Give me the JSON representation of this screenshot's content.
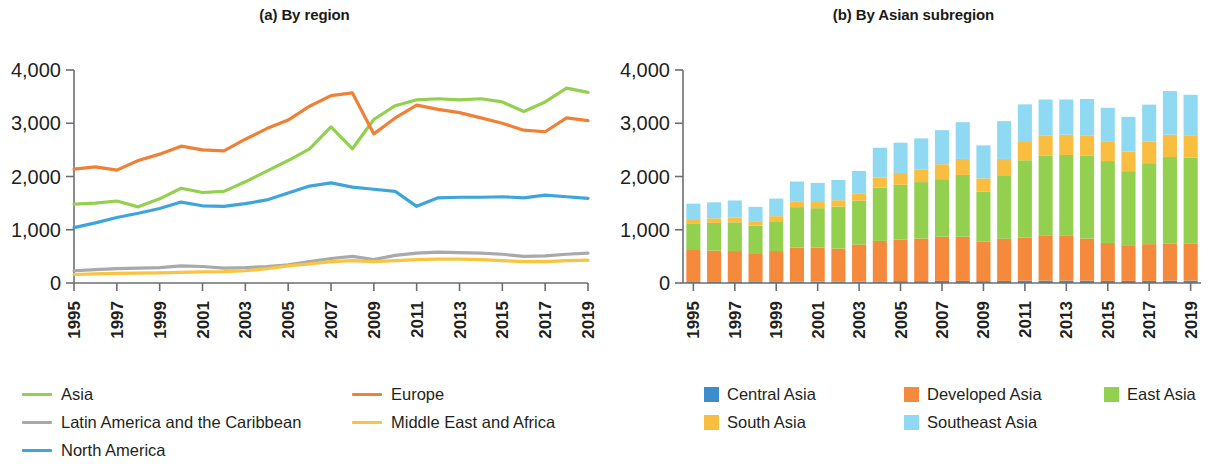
{
  "figure": {
    "panels": [
      {
        "id": "a",
        "tag": "(a)",
        "title": "By region"
      },
      {
        "id": "b",
        "tag": "(b)",
        "title": "By Asian subregion"
      }
    ]
  },
  "chart_data": [
    {
      "type": "line",
      "title": "(a) By region",
      "xlabel": "",
      "ylabel": "",
      "ylim": [
        0,
        4000
      ],
      "yticks": [
        0,
        1000,
        2000,
        3000,
        4000
      ],
      "ytick_labels": [
        "0",
        "1,000",
        "2,000",
        "3,000",
        "4,000"
      ],
      "grid": false,
      "legend_position": "below",
      "x": [
        1995,
        1996,
        1997,
        1998,
        1999,
        2000,
        2001,
        2002,
        2003,
        2004,
        2005,
        2006,
        2007,
        2008,
        2009,
        2010,
        2011,
        2012,
        2013,
        2014,
        2015,
        2016,
        2017,
        2018,
        2019
      ],
      "xtick_labels": [
        "1995",
        "1997",
        "1999",
        "2001",
        "2003",
        "2005",
        "2007",
        "2009",
        "2011",
        "2013",
        "2015",
        "2017",
        "2019"
      ],
      "series": [
        {
          "name": "Asia",
          "color": "#93d04f",
          "values": [
            1480,
            1500,
            1540,
            1430,
            1580,
            1780,
            1700,
            1720,
            1900,
            2100,
            2300,
            2520,
            2930,
            2520,
            3070,
            3330,
            3440,
            3460,
            3440,
            3460,
            3400,
            3220,
            3400,
            3660,
            3580
          ]
        },
        {
          "name": "Europe",
          "color": "#ef8036",
          "values": [
            2140,
            2180,
            2120,
            2300,
            2420,
            2570,
            2500,
            2480,
            2700,
            2900,
            3060,
            3320,
            3520,
            3570,
            2800,
            3100,
            3340,
            3260,
            3200,
            3100,
            3000,
            2870,
            2840,
            3100,
            3050
          ]
        },
        {
          "name": "Latin America and the Caribbean",
          "color": "#a7a9ac",
          "values": [
            230,
            250,
            270,
            280,
            290,
            320,
            310,
            280,
            290,
            310,
            340,
            400,
            460,
            500,
            440,
            520,
            560,
            580,
            570,
            560,
            540,
            500,
            510,
            540,
            560
          ]
        },
        {
          "name": "Middle East and Africa",
          "color": "#f9c440",
          "values": [
            160,
            170,
            180,
            185,
            190,
            200,
            210,
            215,
            230,
            270,
            320,
            360,
            400,
            420,
            400,
            420,
            440,
            450,
            450,
            440,
            420,
            400,
            400,
            420,
            430
          ]
        },
        {
          "name": "North America",
          "color": "#3da5dc",
          "values": [
            1040,
            1130,
            1230,
            1310,
            1400,
            1520,
            1450,
            1440,
            1490,
            1560,
            1690,
            1820,
            1880,
            1800,
            1760,
            1720,
            1440,
            1600,
            1610,
            1610,
            1620,
            1600,
            1650,
            1620,
            1590
          ]
        }
      ]
    },
    {
      "type": "bar",
      "stacked": true,
      "title": "(b) By Asian subregion",
      "xlabel": "",
      "ylabel": "",
      "ylim": [
        0,
        4000
      ],
      "yticks": [
        0,
        1000,
        2000,
        3000,
        4000
      ],
      "ytick_labels": [
        "0",
        "1,000",
        "2,000",
        "3,000",
        "4,000"
      ],
      "grid": false,
      "legend_position": "below",
      "categories": [
        1995,
        1996,
        1997,
        1998,
        1999,
        2000,
        2001,
        2002,
        2003,
        2004,
        2005,
        2006,
        2007,
        2008,
        2009,
        2010,
        2011,
        2012,
        2013,
        2014,
        2015,
        2016,
        2017,
        2018,
        2019
      ],
      "xtick_labels": [
        "1995",
        "1997",
        "1999",
        "2001",
        "2003",
        "2005",
        "2007",
        "2009",
        "2011",
        "2013",
        "2015",
        "2017",
        "2019"
      ],
      "series": [
        {
          "name": "Central Asia",
          "color": "#3d8dcc",
          "values": [
            20,
            20,
            20,
            20,
            20,
            25,
            25,
            25,
            25,
            30,
            35,
            35,
            40,
            40,
            35,
            40,
            45,
            45,
            45,
            45,
            40,
            40,
            40,
            45,
            45
          ]
        },
        {
          "name": "Developed Asia",
          "color": "#f58a3c",
          "values": [
            600,
            590,
            580,
            540,
            580,
            640,
            640,
            620,
            700,
            760,
            780,
            800,
            830,
            830,
            740,
            790,
            810,
            840,
            840,
            790,
            710,
            670,
            690,
            700,
            690
          ]
        },
        {
          "name": "East Asia",
          "color": "#93d04f",
          "values": [
            500,
            520,
            540,
            520,
            560,
            760,
            740,
            790,
            820,
            1000,
            1030,
            1060,
            1080,
            1160,
            940,
            1180,
            1450,
            1510,
            1520,
            1560,
            1540,
            1390,
            1520,
            1620,
            1620
          ]
        },
        {
          "name": "South Asia",
          "color": "#f9bd3f",
          "values": [
            80,
            85,
            90,
            80,
            95,
            110,
            115,
            120,
            140,
            190,
            220,
            240,
            280,
            300,
            250,
            320,
            360,
            370,
            380,
            370,
            360,
            370,
            410,
            420,
            420
          ]
        },
        {
          "name": "Southeast Asia",
          "color": "#8fd9f2",
          "values": [
            290,
            300,
            320,
            270,
            330,
            370,
            360,
            380,
            420,
            560,
            570,
            580,
            640,
            690,
            620,
            710,
            690,
            680,
            660,
            690,
            640,
            650,
            690,
            820,
            760
          ]
        }
      ]
    }
  ],
  "panel_a": {
    "title_tag": "(a)",
    "title_text": "By region",
    "y_tick_labels": [
      "4,000",
      "3,000",
      "2,000",
      "1,000",
      "0"
    ],
    "x_tick_labels": [
      "1995",
      "1997",
      "1999",
      "2001",
      "2003",
      "2005",
      "2007",
      "2009",
      "2011",
      "2013",
      "2015",
      "2017",
      "2019"
    ],
    "legend": [
      {
        "label": "Asia",
        "color": "#93d04f"
      },
      {
        "label": "Europe",
        "color": "#ef8036"
      },
      {
        "label": "Latin America and the Caribbean",
        "color": "#a7a9ac"
      },
      {
        "label": "Middle East and Africa",
        "color": "#f9c440"
      },
      {
        "label": "North America",
        "color": "#3da5dc"
      }
    ]
  },
  "panel_b": {
    "title_tag": "(b)",
    "title_text": "By Asian subregion",
    "y_tick_labels": [
      "4,000",
      "3,000",
      "2,000",
      "1,000",
      "0"
    ],
    "x_tick_labels": [
      "1995",
      "1997",
      "1999",
      "2001",
      "2003",
      "2005",
      "2007",
      "2009",
      "2011",
      "2013",
      "2015",
      "2017",
      "2019"
    ],
    "legend": [
      {
        "label": "Central Asia",
        "color": "#3d8dcc"
      },
      {
        "label": "Developed Asia",
        "color": "#f58a3c"
      },
      {
        "label": "East Asia",
        "color": "#93d04f"
      },
      {
        "label": "South Asia",
        "color": "#f9bd3f"
      },
      {
        "label": "Southeast Asia",
        "color": "#8fd9f2"
      }
    ]
  }
}
